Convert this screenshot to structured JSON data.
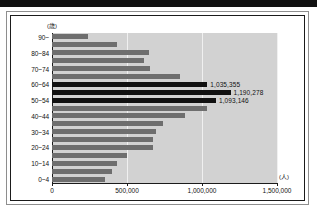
{
  "figure": {
    "unit_y_label": "(歳)",
    "unit_x_label": "(人)"
  },
  "chart_data": {
    "type": "bar",
    "orientation": "horizontal",
    "title": "",
    "subtitle": "",
    "xlabel": "(人)",
    "ylabel": "(歳)",
    "xlim": [
      0,
      1500000
    ],
    "grid": true,
    "legend": null,
    "xticks": [
      0,
      500000,
      1000000,
      1500000
    ],
    "xticklabels": [
      "0",
      "500,000",
      "1,000,000",
      "1,500,000"
    ],
    "categories": [
      "90~",
      "85~89",
      "80~84",
      "75~79",
      "70~74",
      "65~69",
      "60~64",
      "55~59",
      "50~54",
      "45~49",
      "40~44",
      "35~39",
      "30~34",
      "25~29",
      "20~24",
      "15~19",
      "10~14",
      "5~9",
      "0~4"
    ],
    "visible_category_labels": [
      "90~",
      "",
      "80~84",
      "",
      "70~74",
      "",
      "60~64",
      "",
      "50~54",
      "",
      "40~44",
      "",
      "30~34",
      "",
      "20~24",
      "",
      "10~14",
      "",
      "0~4"
    ],
    "values": [
      240000,
      430000,
      645000,
      615000,
      655000,
      855000,
      1035355,
      1190278,
      1093146,
      1030000,
      885000,
      740000,
      695000,
      672000,
      670000,
      500000,
      435000,
      400000,
      355000
    ],
    "highlighted": [
      false,
      false,
      false,
      false,
      false,
      false,
      true,
      true,
      true,
      false,
      false,
      false,
      false,
      false,
      false,
      false,
      false,
      false,
      false
    ],
    "data_labels": [
      "",
      "",
      "",
      "",
      "",
      "",
      "1,035,355",
      "1,190,278",
      "1,093,146",
      "",
      "",
      "",
      "",
      "",
      "",
      "",
      "",
      "",
      ""
    ],
    "colors": {
      "bar": "#6e6e6e",
      "bar_highlight": "#111111",
      "plot_background": "#d2d2d2",
      "gridline": "#f0f0f0",
      "axis": "#1b1b1b",
      "text": "#111111"
    }
  }
}
